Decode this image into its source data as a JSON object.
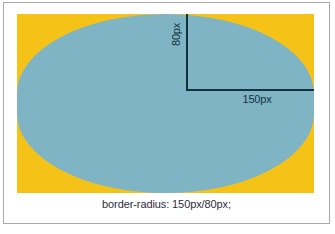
{
  "figure": {
    "caption": "border-radius: 150px/80px;",
    "demo_box": {
      "fill_color": "#f5c318",
      "shape_color": "#7fb4c4",
      "border_radius_value": "150px/80px",
      "horizontal_radius": "150px",
      "vertical_radius": "80px"
    },
    "annotations": {
      "vertical_radius_label": "80px",
      "horizontal_radius_label": "150px",
      "line_color": "#14323c"
    },
    "frame": {
      "border_color": "#a9a9ad",
      "background_color": "#ffffff"
    }
  }
}
